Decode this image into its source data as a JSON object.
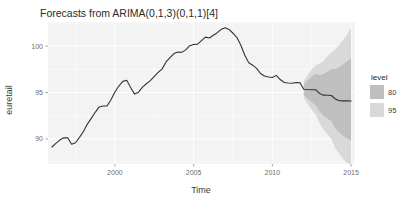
{
  "chart_data": {
    "type": "line",
    "title": "Forecasts from ARIMA(0,1,3)(0,1,1)[4]",
    "xlabel": "Time",
    "ylabel": "euretail",
    "xlim": [
      1995.75,
      2015.25
    ],
    "ylim": [
      87.3,
      102.6
    ],
    "xticks": [
      2000,
      2005,
      2010,
      2015
    ],
    "xtick_labels": [
      "2000",
      "2005",
      "2010",
      "2015"
    ],
    "yticks": [
      90,
      95,
      100
    ],
    "ytick_labels": [
      "90",
      "95",
      "100"
    ],
    "grid": true,
    "legend": {
      "title": "level",
      "position": "right",
      "entries": [
        {
          "label": "80",
          "color": "#bfbfbf"
        },
        {
          "label": "95",
          "color": "#d9d9d9"
        }
      ]
    },
    "colors": {
      "line": "#333333",
      "band_80": "#bfbfbf",
      "band_95": "#d9d9d9",
      "panel_background": "#f3f3f3",
      "gridline": "#ffffff"
    },
    "series": [
      {
        "name": "euretail",
        "kind": "observed",
        "x": [
          1996.0,
          1996.25,
          1996.5,
          1996.75,
          1997.0,
          1997.25,
          1997.5,
          1997.75,
          1998.0,
          1998.25,
          1998.5,
          1998.75,
          1999.0,
          1999.25,
          1999.5,
          1999.75,
          2000.0,
          2000.25,
          2000.5,
          2000.75,
          2001.0,
          2001.25,
          2001.5,
          2001.75,
          2002.0,
          2002.25,
          2002.5,
          2002.75,
          2003.0,
          2003.25,
          2003.5,
          2003.75,
          2004.0,
          2004.25,
          2004.5,
          2004.75,
          2005.0,
          2005.25,
          2005.5,
          2005.75,
          2006.0,
          2006.25,
          2006.5,
          2006.75,
          2007.0,
          2007.25,
          2007.5,
          2007.75,
          2008.0,
          2008.25,
          2008.5,
          2008.75,
          2009.0,
          2009.25,
          2009.5,
          2009.75,
          2010.0,
          2010.25,
          2010.5,
          2010.75,
          2011.0,
          2011.25,
          2011.5,
          2011.75
        ],
        "y": [
          89.13,
          89.52,
          89.88,
          90.12,
          90.13,
          89.43,
          89.59,
          90.17,
          90.8,
          91.6,
          92.22,
          92.87,
          93.45,
          93.55,
          93.55,
          94.22,
          95.05,
          95.7,
          96.2,
          96.32,
          95.55,
          94.83,
          95.04,
          95.58,
          95.95,
          96.28,
          96.73,
          97.17,
          97.55,
          98.3,
          98.77,
          99.2,
          99.36,
          99.33,
          99.6,
          100.05,
          100.18,
          100.22,
          100.6,
          100.97,
          100.88,
          101.18,
          101.45,
          101.81,
          101.98,
          101.8,
          101.39,
          100.92,
          100.1,
          99.02,
          98.21,
          97.95,
          97.6,
          97.05,
          96.78,
          96.67,
          96.62,
          96.85,
          96.4,
          96.08,
          96.03,
          96.0,
          96.08,
          96.05
        ]
      },
      {
        "name": "point forecast",
        "kind": "forecast",
        "x": [
          2012.0,
          2012.25,
          2012.5,
          2012.75,
          2013.0,
          2013.25,
          2013.5,
          2013.75,
          2014.0,
          2014.25,
          2014.5,
          2014.75,
          2015.0
        ],
        "y": [
          95.35,
          95.32,
          95.3,
          95.3,
          94.9,
          94.72,
          94.7,
          94.68,
          94.3,
          94.12,
          94.1,
          94.1,
          94.08
        ]
      }
    ],
    "intervals": [
      {
        "level": 95,
        "color": "#d9d9d9",
        "x": [
          2012.0,
          2012.25,
          2012.5,
          2012.75,
          2013.0,
          2013.25,
          2013.5,
          2013.75,
          2014.0,
          2014.25,
          2014.5,
          2014.75,
          2015.0
        ],
        "lower": [
          94.45,
          93.75,
          93.15,
          92.65,
          91.7,
          91.05,
          90.5,
          90.0,
          89.0,
          88.4,
          87.85,
          87.4,
          87.3
        ],
        "upper": [
          96.25,
          96.9,
          97.45,
          97.95,
          98.1,
          98.4,
          98.9,
          99.35,
          99.6,
          100.15,
          100.7,
          101.25,
          102.0
        ]
      },
      {
        "level": 80,
        "color": "#bfbfbf",
        "x": [
          2012.0,
          2012.25,
          2012.5,
          2012.75,
          2013.0,
          2013.25,
          2013.5,
          2013.75,
          2014.0,
          2014.25,
          2014.5,
          2014.75,
          2015.0
        ],
        "lower": [
          94.75,
          94.3,
          93.95,
          93.65,
          92.95,
          92.5,
          92.2,
          91.9,
          91.15,
          90.7,
          90.35,
          90.05,
          89.8
        ],
        "upper": [
          95.95,
          96.35,
          96.7,
          97.0,
          96.9,
          97.0,
          97.25,
          97.5,
          97.5,
          97.75,
          98.05,
          98.35,
          98.7
        ]
      }
    ]
  }
}
